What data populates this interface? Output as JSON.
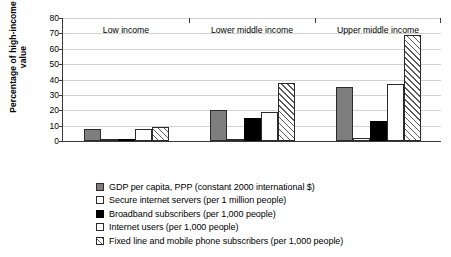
{
  "chart_data": {
    "type": "bar",
    "title": "",
    "xlabel": "",
    "ylabel": "Percentage of high-income value",
    "ylim": [
      0,
      80
    ],
    "yticks": [
      0,
      10,
      20,
      30,
      40,
      50,
      60,
      70,
      80
    ],
    "grid": true,
    "legend_position": "bottom",
    "categories": [
      "Low income",
      "Lower middle income",
      "Upper middle income"
    ],
    "series": [
      {
        "name": "GDP per capita, PPP (constant 2000 international $)",
        "fill": "gray",
        "color": "#7e7e7e",
        "values": [
          8,
          20,
          35
        ]
      },
      {
        "name": "Secure internet servers (per 1 million people)",
        "fill": "white",
        "color": "#ffffff",
        "values": [
          0.4,
          1,
          2
        ]
      },
      {
        "name": "Broadband subscribers (per 1,000 people)",
        "fill": "black",
        "color": "#000000",
        "values": [
          1,
          15,
          13
        ]
      },
      {
        "name": "Internet users (per 1,000 people)",
        "fill": "white",
        "color": "#ffffff",
        "values": [
          8,
          19,
          37
        ]
      },
      {
        "name": "Fixed line and mobile phone subscribers (per 1,000 people)",
        "fill": "hatched",
        "color": "#ffffff",
        "values": [
          9,
          38,
          69
        ]
      }
    ]
  },
  "axis": {
    "ytick_labels": [
      "0",
      "10",
      "20",
      "30",
      "40",
      "50",
      "60",
      "70",
      "80"
    ],
    "y_title": "Percentage of high-income value"
  },
  "legend": {
    "items": [
      {
        "label": "GDP per capita, PPP (constant 2000 international $)"
      },
      {
        "label": "Secure internet servers (per 1 million people)"
      },
      {
        "label": "Broadband subscribers (per 1,000 people)"
      },
      {
        "label": "Internet users (per 1,000 people)"
      },
      {
        "label": "Fixed line and mobile phone subscribers (per 1,000 people)"
      }
    ]
  }
}
